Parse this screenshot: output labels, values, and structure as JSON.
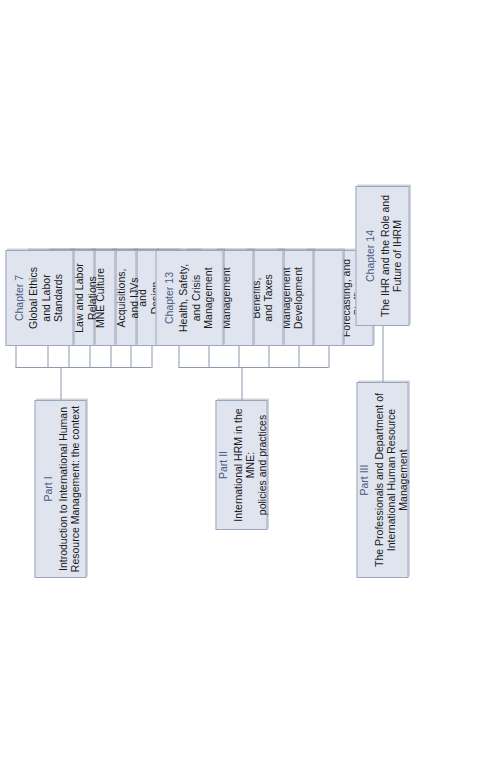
{
  "diagram": {
    "orientation": "rotated-90-ccw",
    "theme": {
      "box_fill": "#dfe4ef",
      "box_border": "#9aa7bd",
      "label_color": "#4a5a82",
      "text_color": "#1a1a1a",
      "line_color": "#8d99ad",
      "background": "#ffffff"
    }
  },
  "parts": [
    {
      "id": "part-1",
      "label": "Part I",
      "title": "Introduction to International Human\nResource Management: the context"
    },
    {
      "id": "part-2",
      "label": "Part II",
      "title": "International HRM in the MNE:\npolicies and practices"
    },
    {
      "id": "part-3",
      "label": "Part III",
      "title": "The Professionals and Department of\nInternational Human Resource Management"
    }
  ],
  "chapters": [
    {
      "id": "chapter-1",
      "part": "part-1",
      "label": "Chapter 1",
      "title": "Introduction\nInternational\nBusiness and\nInternational HRM"
    },
    {
      "id": "chapter-2",
      "part": "part-1",
      "label": "Chapter 2",
      "title": "Strategic\nIHRM"
    },
    {
      "id": "chapter-3",
      "part": "part-1",
      "label": "Chapter 3",
      "title": "Organization\nStructure\nand\nDesign"
    },
    {
      "id": "chapter-4",
      "part": "part-1",
      "label": "Chapter 4",
      "title": "Cross-Border\nMergers,\nAcquisitions,\nand IJVs"
    },
    {
      "id": "chapter-5",
      "part": "part-1",
      "label": "Chapter 5",
      "title": "Country\nCulture and\nMNE Culture"
    },
    {
      "id": "chapter-6",
      "part": "part-1",
      "label": "Chapter 6",
      "title": "Global\nEmployment\nLaw and Labor\nRelations"
    },
    {
      "id": "chapter-7",
      "part": "part-1",
      "label": "Chapter 7",
      "title": "Global Ethics\nand Labor\nStandards"
    },
    {
      "id": "chapter-8",
      "part": "part-2",
      "label": "Chapter 8",
      "title": "Planning,\nForecasting, and\nStaffing"
    },
    {
      "id": "chapter-9",
      "part": "part-2",
      "label": "Chapter 9",
      "title": "Selecting"
    },
    {
      "id": "chapter-10",
      "part": "part-2",
      "label": "Chapter 10",
      "title": "Training and\nManagement\nDevelopment"
    },
    {
      "id": "chapter-11",
      "part": "part-2",
      "label": "Chapter 11",
      "title": "Compensation,\nBenefits,\nand Taxes"
    },
    {
      "id": "chapter-12",
      "part": "part-2",
      "label": "Chapter 12",
      "title": "Performance\nManagement"
    },
    {
      "id": "chapter-13",
      "part": "part-2",
      "label": "Chapter 13",
      "title": "Health, Safety,\nand Crisis\nManagement"
    },
    {
      "id": "chapter-14",
      "part": "part-3",
      "label": "Chapter 14",
      "title": "The IHR and the Role and\nFuture of IHRM"
    }
  ]
}
